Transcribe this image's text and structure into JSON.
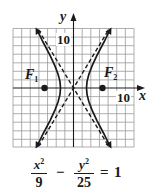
{
  "figure": {
    "axes": {
      "x_label": "x",
      "y_label": "y",
      "x_tick_label": "10",
      "y_tick_label": "10",
      "grid_step_units": 2,
      "x_range": [
        -14,
        14
      ],
      "y_range": [
        -14,
        14
      ]
    },
    "foci": [
      {
        "name": "F",
        "sub": "1",
        "x": -5.83,
        "y": 0
      },
      {
        "name": "F",
        "sub": "2",
        "x": 5.83,
        "y": 0
      }
    ],
    "curve": {
      "type": "hyperbola",
      "a2": 9,
      "b2": 25,
      "asymptotes": [
        "y = 5/3 x",
        "y = -5/3 x"
      ]
    },
    "colors": {
      "ink": "#1a1a1a",
      "grid": "#9a9a9a",
      "background": "#ffffff"
    }
  },
  "equation": {
    "term1_num_var": "x",
    "term1_num_exp": "2",
    "term1_den": "9",
    "minus": "−",
    "term2_num_var": "y",
    "term2_num_exp": "2",
    "term2_den": "25",
    "equals": "=",
    "rhs": "1"
  }
}
